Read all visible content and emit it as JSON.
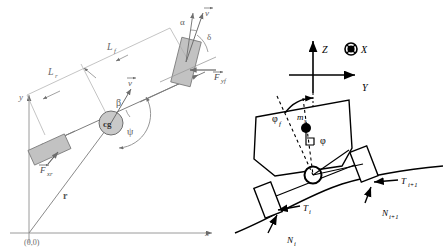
{
  "figure": {
    "background_color": "#ffffff"
  },
  "panels": [
    {
      "id": "left-panel",
      "name": "planar-bicycle-model",
      "description": "Top-view single-track (bicycle) vehicle model in global x-y frame",
      "stroke_color": "#808080",
      "body_fill": "#c8c8c8",
      "axes": {
        "x_label": "x",
        "y_label": "y",
        "origin_label": "(0,0)"
      },
      "labels": [
        {
          "id": "Lf",
          "text": "L",
          "sub": "f",
          "role": "front-axle-distance"
        },
        {
          "id": "Lr",
          "text": "L",
          "sub": "r",
          "role": "rear-axle-distance"
        },
        {
          "id": "cg",
          "text": "cg",
          "sub": "",
          "role": "center-of-gravity"
        },
        {
          "id": "beta",
          "text": "β",
          "sub": "",
          "role": "sideslip-angle"
        },
        {
          "id": "psi",
          "text": "ψ",
          "sub": "",
          "role": "yaw-angle"
        },
        {
          "id": "alpha",
          "text": "α",
          "sub": "",
          "role": "front-tire-slip-angle"
        },
        {
          "id": "delta",
          "text": "δ",
          "sub": "",
          "role": "steering-angle"
        },
        {
          "id": "v_cg",
          "text": "v",
          "sub": "",
          "role": "cg-velocity-vector"
        },
        {
          "id": "v_f",
          "text": "v",
          "sub": "",
          "role": "front-wheel-velocity-vector"
        },
        {
          "id": "Fyf",
          "text": "F",
          "sub": "yf",
          "role": "front-lateral-force"
        },
        {
          "id": "Fxr",
          "text": "F",
          "sub": "xr",
          "role": "rear-longitudinal-force"
        },
        {
          "id": "r",
          "text": "r",
          "sub": "",
          "role": "position-vector"
        }
      ]
    },
    {
      "id": "right-panel",
      "name": "roll-plane-model",
      "description": "Rear-view roll model of sprung mass on banked road with tire forces",
      "stroke_color": "#000000",
      "body_fill": "#ffffff",
      "axes": {
        "z_label": "Z",
        "y_label": "Y",
        "x_label": "X",
        "x_icon": "circle-cross-icon"
      },
      "labels": [
        {
          "id": "phi_f",
          "text": "φ",
          "sub": "f",
          "role": "road-bank-angle"
        },
        {
          "id": "phi",
          "text": "φ",
          "sub": "",
          "role": "body-roll-angle"
        },
        {
          "id": "ms",
          "text": "m",
          "sub": "s",
          "role": "sprung-mass"
        },
        {
          "id": "Ti",
          "text": "T",
          "sub": "i",
          "role": "tire-tangential-force-left"
        },
        {
          "id": "Ni",
          "text": "N",
          "sub": "i",
          "role": "tire-normal-force-left"
        },
        {
          "id": "Ti1",
          "text": "T",
          "sub": "i+1",
          "role": "tire-tangential-force-right"
        },
        {
          "id": "Ni1",
          "text": "N",
          "sub": "i+1",
          "role": "tire-normal-force-right"
        }
      ]
    }
  ]
}
